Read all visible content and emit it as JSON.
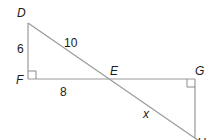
{
  "diagram": {
    "type": "geometry",
    "points": {
      "D": {
        "label": "D",
        "x": 28,
        "y": 23
      },
      "F": {
        "label": "F",
        "x": 28,
        "y": 79
      },
      "E": {
        "label": "E",
        "x": 108,
        "y": 79
      },
      "G": {
        "label": "G",
        "x": 195,
        "y": 79
      },
      "H": {
        "label": "H",
        "x": 195,
        "y": 138
      }
    },
    "segments": [
      {
        "from": "D",
        "to": "F",
        "label": "6"
      },
      {
        "from": "F",
        "to": "G",
        "label": "8"
      },
      {
        "from": "D",
        "to": "H",
        "label": "10"
      },
      {
        "from": "G",
        "to": "H",
        "label": ""
      }
    ],
    "measures": {
      "DF": "6",
      "FE": "8",
      "DE": "10",
      "EH": "x"
    },
    "right_angles": [
      "F",
      "G"
    ],
    "stroke_color": "#9a9a9a",
    "text_color": "#1a1a1a"
  }
}
